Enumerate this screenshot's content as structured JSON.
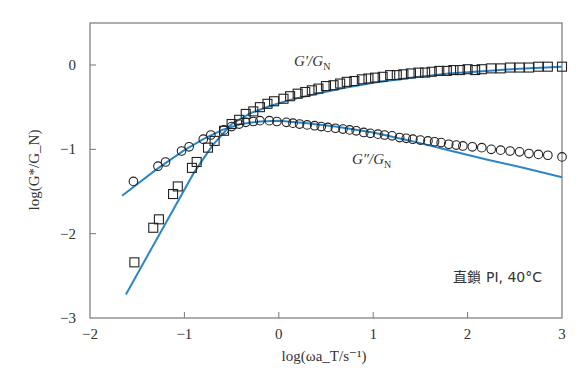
{
  "chart_data": {
    "type": "scatter",
    "title": "",
    "xlabel": "log(ωa_T/s⁻¹)",
    "ylabel": "log(G*/G_N)",
    "xlim": [
      -2,
      3
    ],
    "ylim": [
      -3,
      0.5
    ],
    "x_ticks": [
      -2,
      -1,
      0,
      1,
      2,
      3
    ],
    "y_ticks": [
      -3,
      -2,
      -1,
      0
    ],
    "x_tick_labels": [
      "−2",
      "−1",
      "0",
      "1",
      "2",
      "3"
    ],
    "y_tick_labels": [
      "−3",
      "−2",
      "−1",
      "0"
    ],
    "grid": false,
    "legend": "inline labels",
    "annotation": "直鎖 PI, 40°C",
    "line_color": "#2b86c8",
    "series": [
      {
        "name": "G′/G_N",
        "label": "G′/G",
        "label_sub": "N",
        "marker": "square",
        "x": [
          -1.53,
          -1.33,
          -1.27,
          -1.12,
          -1.07,
          -0.92,
          -0.87,
          -0.75,
          -0.68,
          -0.58,
          -0.5,
          -0.42,
          -0.35,
          -0.27,
          -0.2,
          -0.12,
          -0.05,
          0.05,
          0.12,
          0.2,
          0.28,
          0.35,
          0.42,
          0.5,
          0.58,
          0.65,
          0.72,
          0.8,
          0.88,
          0.95,
          1.02,
          1.1,
          1.18,
          1.25,
          1.32,
          1.4,
          1.48,
          1.55,
          1.62,
          1.7,
          1.78,
          1.85,
          1.92,
          2.0,
          2.08,
          2.15,
          2.25,
          2.35,
          2.45,
          2.55,
          2.65,
          2.75,
          2.85,
          3.0
        ],
        "y": [
          -2.34,
          -1.93,
          -1.83,
          -1.53,
          -1.44,
          -1.22,
          -1.15,
          -0.98,
          -0.9,
          -0.78,
          -0.7,
          -0.65,
          -0.58,
          -0.55,
          -0.5,
          -0.46,
          -0.43,
          -0.4,
          -0.37,
          -0.34,
          -0.32,
          -0.3,
          -0.28,
          -0.25,
          -0.24,
          -0.22,
          -0.2,
          -0.19,
          -0.17,
          -0.16,
          -0.15,
          -0.14,
          -0.12,
          -0.12,
          -0.11,
          -0.1,
          -0.09,
          -0.09,
          -0.08,
          -0.07,
          -0.07,
          -0.06,
          -0.06,
          -0.05,
          -0.06,
          -0.05,
          -0.04,
          -0.04,
          -0.03,
          -0.03,
          -0.03,
          -0.02,
          -0.02,
          -0.02
        ]
      },
      {
        "name": "G″/G_N",
        "label": "G″/G",
        "label_sub": "N",
        "marker": "circle",
        "x": [
          -1.54,
          -1.28,
          -1.2,
          -1.03,
          -0.95,
          -0.8,
          -0.72,
          -0.58,
          -0.5,
          -0.42,
          -0.35,
          -0.27,
          -0.2,
          -0.1,
          -0.02,
          0.08,
          0.15,
          0.22,
          0.3,
          0.38,
          0.45,
          0.52,
          0.6,
          0.68,
          0.75,
          0.82,
          0.9,
          0.97,
          1.05,
          1.12,
          1.2,
          1.28,
          1.35,
          1.42,
          1.5,
          1.58,
          1.65,
          1.72,
          1.8,
          1.88,
          1.95,
          2.05,
          2.15,
          2.25,
          2.35,
          2.45,
          2.55,
          2.65,
          2.75,
          2.85,
          3.0
        ],
        "y": [
          -1.38,
          -1.2,
          -1.15,
          -1.02,
          -0.97,
          -0.88,
          -0.83,
          -0.77,
          -0.73,
          -0.7,
          -0.68,
          -0.67,
          -0.66,
          -0.66,
          -0.67,
          -0.68,
          -0.69,
          -0.7,
          -0.71,
          -0.72,
          -0.73,
          -0.74,
          -0.75,
          -0.76,
          -0.77,
          -0.78,
          -0.8,
          -0.81,
          -0.82,
          -0.83,
          -0.84,
          -0.86,
          -0.87,
          -0.88,
          -0.89,
          -0.9,
          -0.91,
          -0.92,
          -0.94,
          -0.95,
          -0.96,
          -0.97,
          -0.98,
          -1.0,
          -1.01,
          -1.02,
          -1.03,
          -1.05,
          -1.06,
          -1.07,
          -1.09
        ]
      }
    ],
    "fit_lines": [
      {
        "name": "G′ fit",
        "x": [
          -1.62,
          -1.2,
          -0.9,
          -0.7,
          -0.5,
          -0.3,
          -0.1,
          0.1,
          0.4,
          0.7,
          1.0,
          1.4,
          1.8,
          2.2,
          2.6,
          3.0
        ],
        "y": [
          -2.72,
          -1.88,
          -1.28,
          -0.95,
          -0.7,
          -0.57,
          -0.49,
          -0.42,
          -0.34,
          -0.27,
          -0.21,
          -0.15,
          -0.1,
          -0.07,
          -0.04,
          -0.02
        ]
      },
      {
        "name": "G″ fit",
        "x": [
          -1.66,
          -1.3,
          -1.0,
          -0.8,
          -0.6,
          -0.4,
          -0.2,
          0.0,
          0.3,
          0.6,
          1.0,
          1.4,
          1.8,
          2.2,
          2.6,
          3.0
        ],
        "y": [
          -1.55,
          -1.24,
          -1.01,
          -0.88,
          -0.77,
          -0.7,
          -0.67,
          -0.66,
          -0.69,
          -0.73,
          -0.8,
          -0.9,
          -1.01,
          -1.12,
          -1.22,
          -1.33
        ]
      }
    ]
  }
}
